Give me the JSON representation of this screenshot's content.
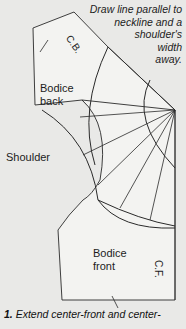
{
  "caption": {
    "lines": [
      "Draw line parallel to",
      "neckline and a",
      "shoulder's",
      "width",
      "away."
    ]
  },
  "labels": {
    "bodice_back": [
      "Bodice",
      "back"
    ],
    "shoulder": "Shoulder",
    "bodice_front": [
      "Bodice",
      "front"
    ],
    "center_back": "C.B.",
    "center_front": "C.F."
  },
  "step": {
    "number": "1.",
    "text": " Extend center-front and center-"
  },
  "colors": {
    "background": "#e9e9e7",
    "paper": "#f2f2f0",
    "line": "#2a2a2a"
  }
}
